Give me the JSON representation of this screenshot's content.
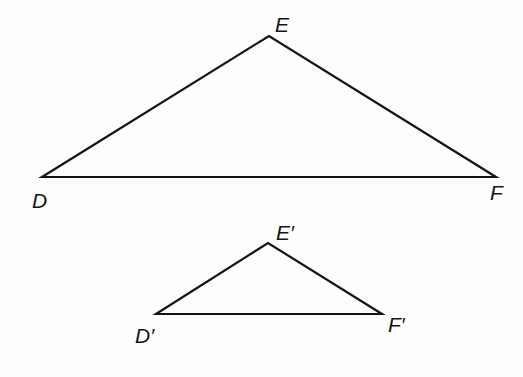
{
  "diagram": {
    "type": "similar-triangles",
    "triangles": [
      {
        "name": "DEF",
        "vertices": {
          "D": {
            "label": "D",
            "x": 42,
            "y": 177
          },
          "E": {
            "label": "E",
            "x": 269,
            "y": 36
          },
          "F": {
            "label": "F",
            "x": 496,
            "y": 177
          }
        },
        "labels": {
          "D": {
            "x": 32,
            "y": 208
          },
          "E": {
            "x": 275,
            "y": 32
          },
          "F": {
            "x": 490,
            "y": 200
          }
        }
      },
      {
        "name": "D'E'F'",
        "vertices": {
          "D": {
            "label": "D′",
            "x": 156,
            "y": 314
          },
          "E": {
            "label": "E′",
            "x": 268,
            "y": 243
          },
          "F": {
            "label": "F′",
            "x": 382,
            "y": 314
          }
        },
        "labels": {
          "D": {
            "x": 135,
            "y": 343
          },
          "E": {
            "x": 276,
            "y": 240
          },
          "F": {
            "x": 388,
            "y": 332
          }
        }
      }
    ],
    "stroke_color": "#141414",
    "background_color": "#fdfdfd"
  }
}
